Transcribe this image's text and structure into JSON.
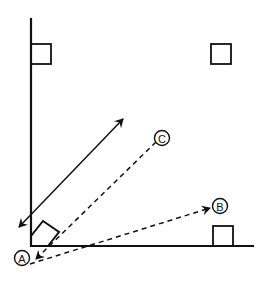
{
  "diagram": {
    "type": "schematic-room-diagram",
    "stroke_color": "#111111",
    "background": "#ffffff",
    "labels": {
      "a": "A",
      "b": "B",
      "c": "C"
    },
    "elements": {
      "wall": "vertical axis line",
      "floor": "horizontal axis line",
      "squares": [
        "top-left square on wall",
        "top-right square",
        "bottom-right square on floor",
        "tilted square in corner"
      ],
      "arrows": [
        {
          "style": "solid",
          "heads": "both",
          "from": "lower-left near corner",
          "to": "upper-middle"
        },
        {
          "style": "dashed",
          "heads": "end",
          "from": "C",
          "to": "A"
        },
        {
          "style": "dashed",
          "heads": "end",
          "from": "A",
          "to": "B"
        }
      ]
    }
  }
}
